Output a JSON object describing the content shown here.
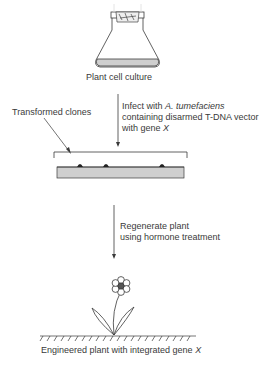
{
  "diagram": {
    "steps": [
      {
        "label": "Plant cell culture"
      },
      {
        "label_parts": [
          "Infect with ",
          "A. tumefaciens",
          ""
        ],
        "line2": "containing disarmed T-DNA vector",
        "line3_parts": [
          "with gene ",
          "X"
        ]
      },
      {
        "label": "Transformed clones"
      },
      {
        "line1": "Regenerate plant",
        "line2": "using hormone treatment"
      },
      {
        "label_parts": [
          "Engineered plant with integrated gene ",
          "X"
        ]
      }
    ],
    "colors": {
      "line": "#3a3a3a",
      "medium": "#cfcfcf",
      "colony": "#222222",
      "flower_center": "#555555"
    }
  }
}
